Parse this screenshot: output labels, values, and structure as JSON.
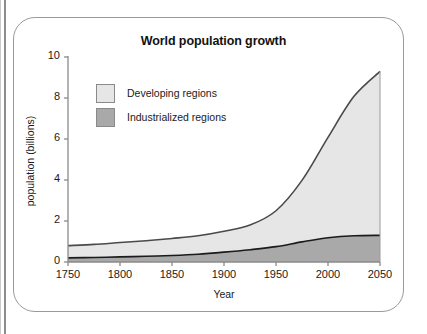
{
  "chart_data": {
    "type": "area",
    "title": "World population growth",
    "xlabel": "Year",
    "ylabel": "population (billions)",
    "xlim": [
      1750,
      2050
    ],
    "ylim": [
      0,
      10
    ],
    "xticks": [
      1750,
      1800,
      1850,
      1900,
      1950,
      2000,
      2050
    ],
    "yticks": [
      0,
      2,
      4,
      6,
      8,
      10
    ],
    "grid": false,
    "stacked": true,
    "legend_position": "inside-top-left",
    "x": [
      1750,
      1775,
      1800,
      1825,
      1850,
      1875,
      1900,
      1925,
      1950,
      1975,
      2000,
      2025,
      2050
    ],
    "series": [
      {
        "name": "Industrialized regions",
        "color": "#a9a9a9",
        "line_color": "#1b1b1b",
        "values": [
          0.2,
          0.22,
          0.25,
          0.28,
          0.32,
          0.38,
          0.48,
          0.6,
          0.75,
          0.98,
          1.18,
          1.28,
          1.3
        ]
      },
      {
        "name": "Developing regions",
        "color": "#e6e6e6",
        "line_color": "#4a4a4a",
        "values": [
          0.6,
          0.64,
          0.7,
          0.76,
          0.83,
          0.9,
          1.02,
          1.2,
          1.75,
          3.0,
          4.9,
          6.8,
          8.0
        ]
      }
    ],
    "total_top": [
      0.8,
      0.86,
      0.95,
      1.04,
      1.15,
      1.28,
      1.5,
      1.8,
      2.5,
      3.98,
      6.08,
      8.08,
      9.3
    ],
    "axis_color": "#8a8a8a",
    "text_color": "#1a1a1a"
  },
  "legend": {
    "items": [
      {
        "label": "Developing regions",
        "swatch": "#e6e6e6"
      },
      {
        "label": "Industrialized regions",
        "swatch": "#a9a9a9"
      }
    ]
  },
  "ticks": {
    "y": [
      "10",
      "8",
      "6",
      "4",
      "2",
      "0"
    ],
    "x": [
      "1750",
      "1800",
      "1850",
      "1900",
      "1950",
      "2000",
      "2050"
    ]
  }
}
